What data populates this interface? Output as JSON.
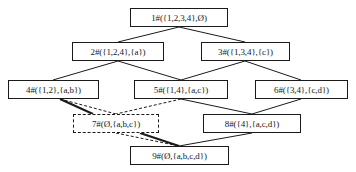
{
  "diagram": {
    "type": "concept-lattice",
    "nodes": [
      {
        "id": 1,
        "label": "1#({1,2,3,4},Ø)",
        "x": 130,
        "y": 8,
        "w": 98,
        "h": 19,
        "style": "solid"
      },
      {
        "id": 2,
        "label": "2#({1,2,4},{a})",
        "x": 72,
        "y": 42,
        "w": 92,
        "h": 19,
        "style": "solid"
      },
      {
        "id": 3,
        "label": "3#({1,3,4},{c})",
        "x": 201,
        "y": 42,
        "w": 89,
        "h": 19,
        "style": "solid"
      },
      {
        "id": 4,
        "label": "4#({1,2},{a,b})",
        "x": 8,
        "y": 80,
        "w": 91,
        "h": 19,
        "style": "solid"
      },
      {
        "id": 5,
        "label": "5#({1,4},{a,c})",
        "x": 134,
        "y": 80,
        "w": 94,
        "h": 19,
        "style": "solid"
      },
      {
        "id": 6,
        "label": "6#({3,4},{c,d})",
        "x": 255,
        "y": 80,
        "w": 93,
        "h": 19,
        "style": "solid"
      },
      {
        "id": 7,
        "label": "7#(Ø,{a,b,c})",
        "x": 73,
        "y": 114,
        "w": 86,
        "h": 19,
        "style": "dashed"
      },
      {
        "id": 8,
        "label": "8#({4},{a,c,d})",
        "x": 203,
        "y": 114,
        "w": 98,
        "h": 19,
        "style": "solid"
      },
      {
        "id": 9,
        "label": "9#(Ø,{a,b,c,d})",
        "x": 130,
        "y": 146,
        "w": 99,
        "h": 19,
        "style": "solid"
      }
    ],
    "edges": [
      {
        "from": 1,
        "to": 2,
        "style": "solid"
      },
      {
        "from": 1,
        "to": 3,
        "style": "solid"
      },
      {
        "from": 2,
        "to": 4,
        "style": "solid"
      },
      {
        "from": 2,
        "to": 5,
        "style": "solid"
      },
      {
        "from": 3,
        "to": 5,
        "style": "solid"
      },
      {
        "from": 3,
        "to": 6,
        "style": "solid"
      },
      {
        "from": 4,
        "to": 7,
        "style": "dashed"
      },
      {
        "from": 5,
        "to": 7,
        "style": "dashed"
      },
      {
        "from": 4,
        "to": 9,
        "style": "bold"
      },
      {
        "from": 7,
        "to": 9,
        "style": "dashed"
      },
      {
        "from": 5,
        "to": 8,
        "style": "solid"
      },
      {
        "from": 6,
        "to": 8,
        "style": "solid"
      },
      {
        "from": 8,
        "to": 9,
        "style": "solid"
      }
    ]
  },
  "colors": {
    "line": "#1a1a1a",
    "background": "#ffffff"
  }
}
